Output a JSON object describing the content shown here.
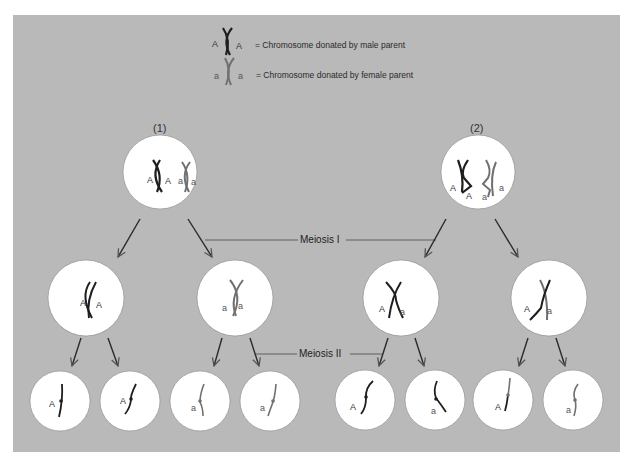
{
  "legend": {
    "male": {
      "left_label": "A",
      "right_label": "A",
      "text": "= Chromosome donated by male parent",
      "color": "#1e1e1e"
    },
    "female": {
      "left_label": "a",
      "right_label": "a",
      "text": "= Chromosome donated by female parent",
      "color": "#6e6e6e"
    }
  },
  "cases": [
    {
      "label": "(1)"
    },
    {
      "label": "(2)"
    }
  ],
  "stages": {
    "meiosis1": "Meiosis I",
    "meiosis2": "Meiosis II"
  },
  "alleles": {
    "top1": [
      "A",
      "A",
      "a",
      "a"
    ],
    "top2": [
      "A",
      "A",
      "a",
      "a"
    ],
    "mid": [
      [
        "A",
        "A"
      ],
      [
        "a",
        "a"
      ],
      [
        "A",
        "a"
      ],
      [
        "A",
        "a"
      ]
    ],
    "bottom": [
      "A",
      "A",
      "a",
      "a",
      "A",
      "a",
      "A",
      "a"
    ]
  },
  "colors": {
    "background": "#b9b9b9",
    "cell": "#ffffff",
    "male_chromosome": "#1e1e1e",
    "female_chromosome": "#6e6e6e",
    "arrow": "#2a2a2a"
  }
}
